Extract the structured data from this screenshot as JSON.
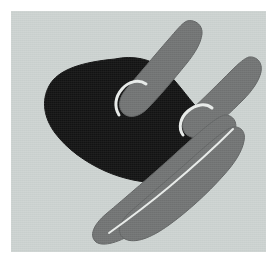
{
  "artwork": {
    "title": "Abstract Hand",
    "medium": "flat-color illustration",
    "canvas": {
      "width": 277,
      "height": 265
    },
    "panel": {
      "x": 11,
      "y": 11,
      "width": 255,
      "height": 241
    },
    "colors": {
      "page_background": "#ffffff",
      "panel_background": "#ccd2d0",
      "dark_mass": "#0d0d0d",
      "mid_gray_digit": "#6e7070",
      "outline_light": "#e9ecea",
      "outline_dark": "#3a3c3c"
    },
    "shapes": [
      {
        "name": "palm-mass",
        "role": "dark central body of the hand",
        "fill": "#0d0d0d",
        "path": "M 104 48 C 122 44 140 48 152 58 C 162 66 172 80 182 92 C 192 104 204 114 210 126 C 216 138 212 150 200 158 C 186 167 168 172 150 172 C 132 172 112 168 94 160 C 74 151 56 138 44 122 C 33 107 30 90 38 75 C 47 58 72 51 104 48 Z"
      },
      {
        "name": "index-finger",
        "role": "upper extended digit pointing up-right",
        "fill": "#6e7070",
        "path": "M 176 10 C 184 8 192 14 191 23 C 190 32 184 42 176 52 C 163 68 148 86 136 98 C 128 106 118 108 112 102 C 106 96 108 86 116 77 C 128 63 144 44 157 29 C 165 20 171 12 176 10 Z"
      },
      {
        "name": "index-finger-knuckle-outline",
        "role": "light arc where upper digit meets the dark mass",
        "stroke": "#e9ecea",
        "path": "M 108 104 C 103 96 104 86 111 78 C 118 70 128 68 135 73"
      },
      {
        "name": "middle-finger",
        "role": "second extended digit pointing up-right",
        "fill": "#6e7070",
        "path": "M 238 46 C 246 45 252 52 250 61 C 248 70 241 80 232 89 C 220 101 206 114 196 122 C 188 128 179 128 174 122 C 169 115 172 106 180 99 C 192 88 208 72 220 60 C 228 52 234 47 238 46 Z"
      },
      {
        "name": "middle-finger-knuckle-outline",
        "role": "light arc where second digit meets the dark mass",
        "stroke": "#e9ecea",
        "path": "M 172 124 C 167 117 169 107 177 100 C 185 93 195 92 201 97"
      },
      {
        "name": "thumb-upper",
        "role": "upper crossing digit rising from lower-left to mid",
        "fill": "#6e7070",
        "path": "M 222 116 C 230 115 235 121 233 130 C 231 141 223 153 212 165 C 196 183 176 201 158 214 C 140 227 124 233 114 228 C 105 223 107 212 119 201 C 136 186 160 166 180 148 C 198 132 214 118 222 116 Z"
      },
      {
        "name": "thumb-lower",
        "role": "lower crossing digit sweeping to bottom-left",
        "fill": "#6e7070",
        "path": "M 214 104 C 222 104 227 111 224 120 C 220 133 208 148 194 163 C 174 184 150 205 128 219 C 108 232 92 236 85 231 C 78 225 82 214 95 203 C 114 187 142 163 164 143 C 186 123 206 105 214 104 Z"
      },
      {
        "name": "thumb-divider-outline",
        "role": "light seam separating the two crossing digits",
        "stroke": "#e9ecea",
        "path": "M 222 118 C 206 134 182 156 158 176 C 134 196 112 212 98 222"
      }
    ]
  }
}
